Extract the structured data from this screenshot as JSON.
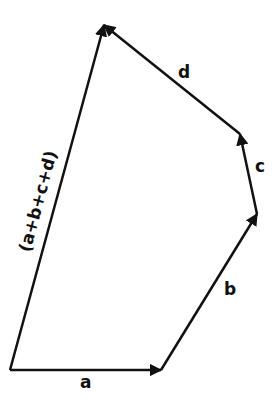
{
  "diagram": {
    "color": "#111111",
    "vectors": [
      {
        "name": "a",
        "label": "a",
        "from": [
          10,
          370
        ],
        "to": [
          161,
          370
        ]
      },
      {
        "name": "b",
        "label": "b",
        "from": [
          161,
          370
        ],
        "to": [
          257,
          214
        ]
      },
      {
        "name": "c",
        "label": "c",
        "from": [
          257,
          214
        ],
        "to": [
          240,
          134
        ]
      },
      {
        "name": "d",
        "label": "d",
        "from": [
          240,
          134
        ],
        "to": [
          104,
          25
        ]
      },
      {
        "name": "resultant",
        "label": "(a+b+c+d)",
        "from": [
          10,
          370
        ],
        "to": [
          104,
          25
        ]
      }
    ]
  }
}
